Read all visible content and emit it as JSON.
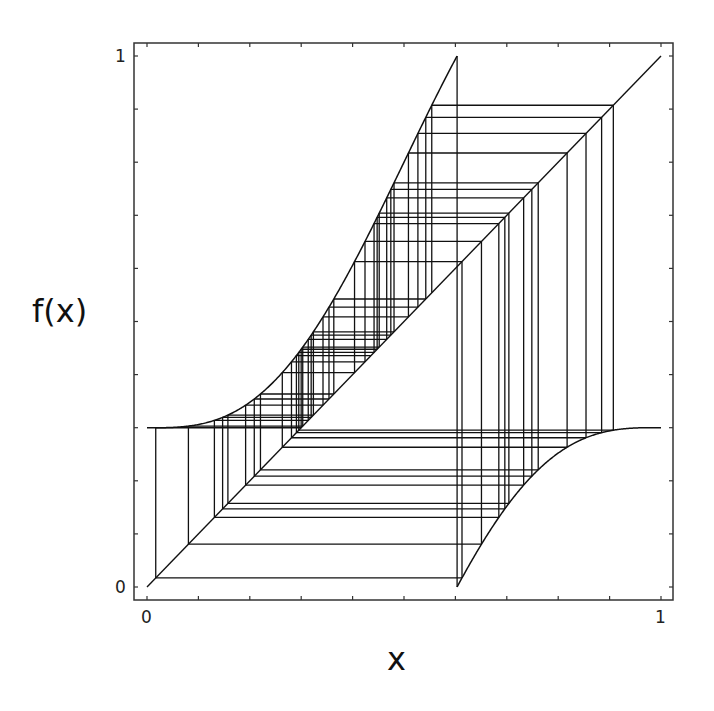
{
  "chart_data": {
    "type": "line",
    "title": "",
    "xlabel": "x",
    "ylabel": "f(x)",
    "xlim": [
      0,
      1
    ],
    "ylim": [
      0,
      1
    ],
    "grid": false,
    "legend": null,
    "x_tick_labels": [
      "0",
      "1"
    ],
    "y_tick_labels": [
      "0",
      "1"
    ],
    "minor_tick_step": 0.1,
    "function": {
      "description": "circle map f(x) = (x + Omega - (K/2pi) sin(2 pi x)) mod 1",
      "omega": 0.3,
      "k_over_2pi": 0.16,
      "discontinuity_x": 0.603,
      "left_branch_samples": [
        [
          0.0,
          0.3
        ],
        [
          0.093,
          0.308
        ],
        [
          0.198,
          0.335
        ],
        [
          0.308,
          0.454
        ],
        [
          0.366,
          0.55
        ],
        [
          0.428,
          0.662
        ],
        [
          0.483,
          0.764
        ],
        [
          0.603,
          1.0
        ]
      ],
      "right_branch_samples": [
        [
          0.603,
          0.0
        ],
        [
          0.7,
          0.15
        ],
        [
          0.8,
          0.25
        ],
        [
          0.9,
          0.29
        ],
        [
          1.0,
          0.3
        ]
      ]
    },
    "series": [
      {
        "name": "f(x)",
        "style": "curve"
      },
      {
        "name": "identity y=x",
        "style": "diagonal",
        "values": [
          [
            0,
            0
          ],
          [
            1,
            1
          ]
        ]
      },
      {
        "name": "cobweb orbit",
        "style": "staircase",
        "start_x": 0.554,
        "iterations": 44
      }
    ]
  },
  "labels": {
    "x_axis": "x",
    "y_axis": "f(x)",
    "x_min": "0",
    "x_max": "1",
    "y_min": "0",
    "y_max": "1"
  },
  "colors": {
    "line": "#111111",
    "frame": "#333333",
    "background": "#ffffff"
  }
}
